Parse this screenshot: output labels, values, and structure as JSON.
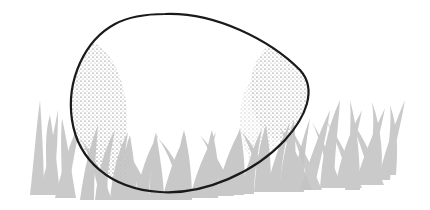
{
  "illustration": {
    "subject": "egg resting in grass",
    "style": "ink line drawing with stippled shading",
    "colors": {
      "background": "#ffffff",
      "outline": "#1a1a1a",
      "stipple": "#333333",
      "grass": "#c4c4c4"
    }
  }
}
